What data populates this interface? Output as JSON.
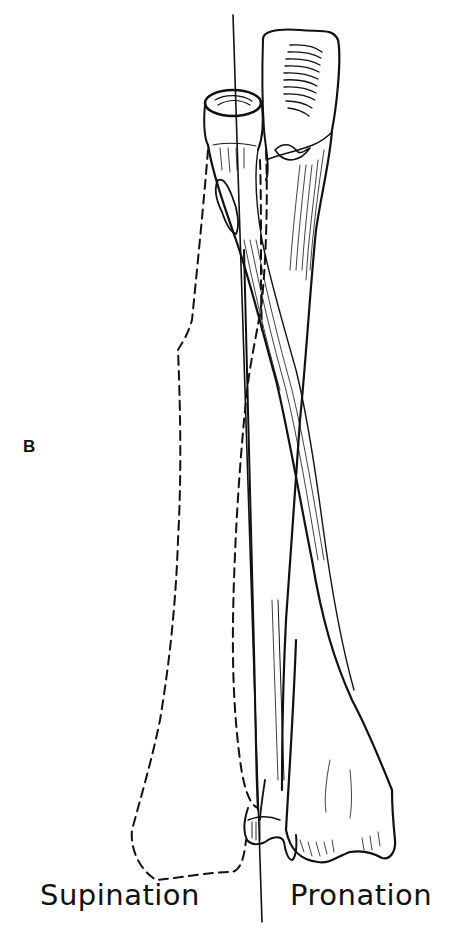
{
  "figure": {
    "panel_label": "B",
    "captions": {
      "left": "Supination",
      "right": "Pronation"
    },
    "colors": {
      "ink": "#111111",
      "background": "#ffffff"
    }
  }
}
